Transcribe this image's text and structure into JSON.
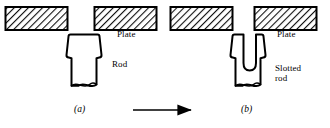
{
  "figure": {
    "type": "engineering-process-diagram",
    "stroke_color": "#000000",
    "hatch_color": "#1a1a1a",
    "background_color": "#ffffff"
  },
  "panels": [
    {
      "id": "a",
      "caption": "(a)",
      "labels": {
        "plate": "Plate",
        "part": "Rod"
      },
      "parts": {
        "left_plate": "plate-left-a",
        "right_plate": "plate-right-a",
        "rod": "rod-solid"
      }
    },
    {
      "id": "b",
      "caption": "(b)",
      "labels": {
        "plate": "Plate",
        "part": "Slotted\nrod"
      },
      "part_label_lines": [
        "Slotted",
        "rod"
      ],
      "parts": {
        "left_plate": "plate-left-b",
        "right_plate": "plate-right-b",
        "rod": "rod-slotted"
      }
    }
  ],
  "transition": {
    "symbol": "arrow-right",
    "from_panel": "a",
    "to_panel": "b"
  }
}
